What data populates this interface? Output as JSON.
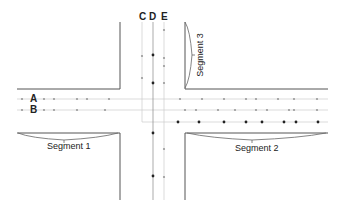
{
  "labels": {
    "lane_a": "A",
    "lane_b": "B",
    "lane_c": "C",
    "lane_d": "D",
    "lane_e": "E",
    "segment1": "Segment 1",
    "segment2": "Segment 2",
    "segment3": "Segment 3"
  },
  "colors": {
    "curb": "#555555",
    "lane_line": "#cccccc",
    "point_dark": "#222222",
    "point_light": "#999999"
  },
  "lanes": {
    "A": {
      "y": 99,
      "points_x": [
        22,
        44,
        54,
        77,
        87,
        109,
        180,
        202,
        224,
        246,
        256,
        278,
        294,
        317
      ],
      "style": "light"
    },
    "B": {
      "y": 110,
      "points_x": [
        22,
        44,
        54,
        77,
        105,
        185,
        196,
        218,
        235,
        256,
        267,
        289,
        294,
        317
      ],
      "style": "light"
    },
    "B2": {
      "y": 122,
      "points_x": [
        178,
        199,
        224,
        246,
        262,
        284,
        296,
        318
      ],
      "style": "dark"
    },
    "C": {
      "x": 142,
      "points_y": [
        56,
        78
      ],
      "style": "light"
    },
    "D": {
      "x": 153,
      "points_y": [
        55,
        83,
        133,
        176
      ],
      "style": "dark"
    },
    "E": {
      "x": 164,
      "points_y": [
        30,
        58,
        66,
        83,
        149,
        177
      ],
      "style": "light"
    }
  }
}
